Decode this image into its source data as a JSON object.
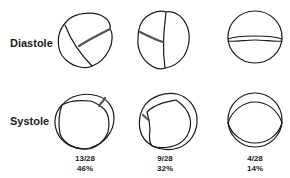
{
  "rows": {
    "diastole_label": "Diastole",
    "systole_label": "Systole"
  },
  "columns": [
    {
      "fraction": "13/28",
      "percent": "46%"
    },
    {
      "fraction": "9/28",
      "percent": "32%"
    },
    {
      "fraction": "4/28",
      "percent": "14%"
    }
  ],
  "colors": {
    "ink": "#1a1a1a",
    "background": "#ffffff"
  }
}
